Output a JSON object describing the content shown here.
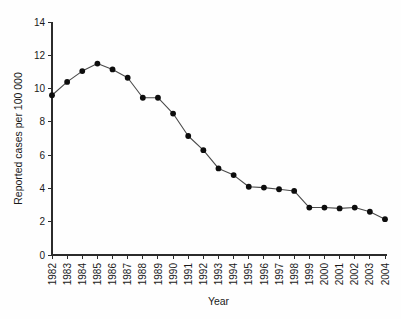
{
  "chart_data": {
    "type": "line",
    "title": "",
    "subtitle": "",
    "xlabel": "Year",
    "ylabel": "Reported cases per 100 000",
    "categories": [
      "1982",
      "1983",
      "1984",
      "1985",
      "1986",
      "1987",
      "1988",
      "1989",
      "1990",
      "1991",
      "1992",
      "1993",
      "1994",
      "1995",
      "1996",
      "1997",
      "1998",
      "1999",
      "2000",
      "2001",
      "2002",
      "2003",
      "2004"
    ],
    "values": [
      9.6,
      10.4,
      11.05,
      11.5,
      11.15,
      10.65,
      9.45,
      9.45,
      8.5,
      7.15,
      6.3,
      5.2,
      4.8,
      4.1,
      4.05,
      3.95,
      3.85,
      2.85,
      2.85,
      2.8,
      2.85,
      2.6,
      2.15
    ],
    "ylim": [
      0,
      14
    ],
    "ytick_labels": [
      "0",
      "2",
      "4",
      "6",
      "8",
      "10",
      "12",
      "14"
    ],
    "ytick_values": [
      0,
      2,
      4,
      6,
      8,
      10,
      12,
      14
    ],
    "grid": false,
    "legend": false,
    "legend_position": "none",
    "xtick_rotation_degrees": 90,
    "marker": "filled-circle",
    "colors": {
      "line": "#4a4a4a",
      "marker": "#0d0d0d",
      "axis": "#2b2b2b",
      "text": "#1a1a1a",
      "background": "#fefefe"
    }
  },
  "axes": {
    "x_axis_name": "year-axis",
    "y_axis_name": "reported-cases-axis"
  }
}
